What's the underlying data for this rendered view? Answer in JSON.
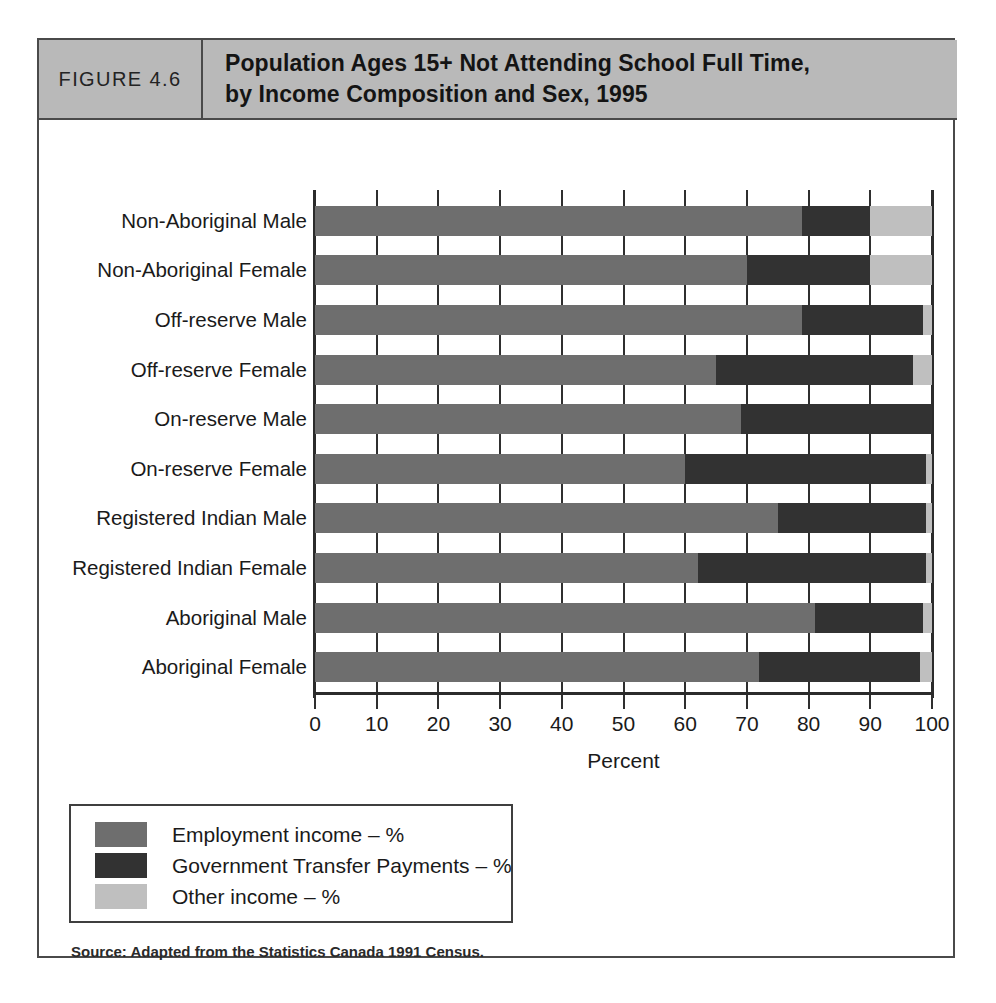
{
  "figure": {
    "number_label": "FIGURE 4.6",
    "title_line1": "Population Ages 15+ Not Attending School Full Time,",
    "title_line2": "by Income Composition and Sex, 1995",
    "source": "Source: Adapted from the Statistics Canada 1991 Census."
  },
  "colors": {
    "employment": "#6e6e6e",
    "government": "#323232",
    "other": "#bfbfbf",
    "header_band": "#b9b9b9",
    "frame": "#4a4a4a",
    "axis": "#2b2b2b"
  },
  "chart_data": {
    "type": "bar",
    "orientation": "horizontal",
    "stacked": true,
    "stack_total": 100,
    "title": "Population Ages 15+ Not Attending School Full Time, by Income Composition and Sex, 1995",
    "xlabel": "Percent",
    "ylabel": "",
    "xlim": [
      0,
      100
    ],
    "xticks": [
      0,
      10,
      20,
      30,
      40,
      50,
      60,
      70,
      80,
      90,
      100
    ],
    "xtick_labels": [
      "0",
      "10",
      "20",
      "30",
      "40",
      "50",
      "60",
      "70",
      "80",
      "90",
      "100"
    ],
    "grid": true,
    "legend_position": "below-left",
    "categories": [
      "Non-Aboriginal Male",
      "Non-Aboriginal Female",
      "Off-reserve Male",
      "Off-reserve Female",
      "On-reserve Male",
      "On-reserve Female",
      "Registered Indian Male",
      "Registered Indian Female",
      "Aboriginal Male",
      "Aboriginal Female"
    ],
    "series": [
      {
        "name": "Employment income – %",
        "color": "#6e6e6e",
        "values": [
          79,
          70,
          79,
          65,
          69,
          60,
          75,
          62,
          81,
          72
        ]
      },
      {
        "name": "Government Transfer Payments – %",
        "color": "#323232",
        "values": [
          11,
          20,
          19.5,
          32,
          31,
          39,
          24,
          37,
          17.5,
          26
        ]
      },
      {
        "name": "Other income – %",
        "color": "#bfbfbf",
        "values": [
          10,
          10,
          1.5,
          3,
          0,
          1,
          1,
          1,
          1.5,
          2
        ]
      }
    ]
  },
  "legend": {
    "items": [
      {
        "label": "Employment income – %",
        "color": "#6e6e6e"
      },
      {
        "label": "Government Transfer Payments – %",
        "color": "#323232"
      },
      {
        "label": "Other income – %",
        "color": "#bfbfbf"
      }
    ]
  }
}
